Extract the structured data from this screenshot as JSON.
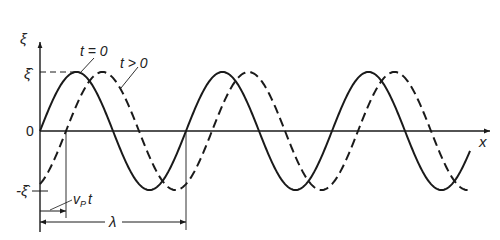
{
  "diagram": {
    "axes": {
      "y_label": "ξ",
      "x_label": "x",
      "origin_label": "0",
      "amplitude_pos_label": "ξ̂",
      "amplitude_neg_label": "-ξ̂"
    },
    "curves": [
      {
        "name": "t = 0",
        "style": "solid",
        "label": "t = 0"
      },
      {
        "name": "t > 0",
        "style": "dashed",
        "label": "t > 0"
      }
    ],
    "annotations": {
      "shift_label": "v",
      "shift_sub": "P",
      "shift_suffix": "t",
      "wavelength_label": "λ"
    },
    "geometry": {
      "origin_x": 40,
      "zero_y": 131,
      "amplitude_px": 59,
      "wavelength_px": 146,
      "shift_px": 26,
      "x_end": 470
    },
    "colors": {
      "line": "#1a1a1a",
      "text": "#222222"
    }
  }
}
